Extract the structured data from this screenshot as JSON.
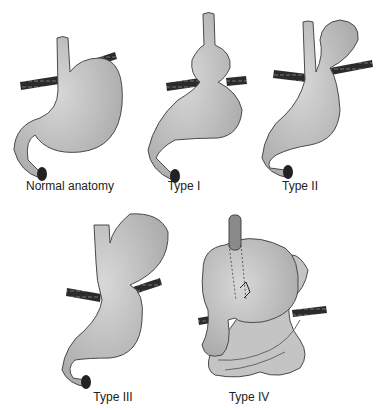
{
  "diagram": {
    "panels": [
      {
        "id": "normal",
        "label": "Normal anatomy"
      },
      {
        "id": "type1",
        "label": "Type I"
      },
      {
        "id": "type2",
        "label": "Type II"
      },
      {
        "id": "type3",
        "label": "Type III"
      },
      {
        "id": "type4",
        "label": "Type IV"
      }
    ]
  },
  "colors": {
    "organ_fill": "#bdbdbd",
    "organ_stroke": "#4a4a4a",
    "diaphragm": "#2b2b2b",
    "background": "#ffffff"
  }
}
